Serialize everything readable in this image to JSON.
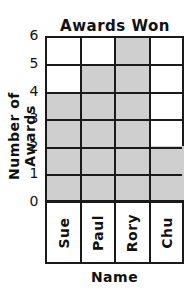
{
  "chart_data": {
    "type": "bar",
    "title": "Awards Won",
    "xlabel": "Name",
    "ylabel": "Number of Awards",
    "categories": [
      "Sue",
      "Paul",
      "Rory",
      "Chu"
    ],
    "values": [
      4,
      5,
      6,
      2
    ],
    "ylim": [
      0,
      6
    ],
    "yticks": [
      "0",
      "1",
      "2",
      "3",
      "4",
      "5",
      "6"
    ],
    "grid": true,
    "bar_color": "#cfcfcf",
    "orientation": "vertical"
  }
}
